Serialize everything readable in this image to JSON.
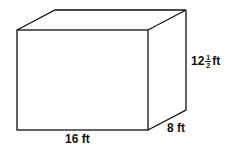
{
  "figure": {
    "shape": "rectangular prism",
    "labels": {
      "length": "16 ft",
      "width": "8 ft",
      "height_whole": "12",
      "height_numerator": "1",
      "height_denominator": "2",
      "height_unit": "ft"
    },
    "stroke_color": "#111111"
  }
}
